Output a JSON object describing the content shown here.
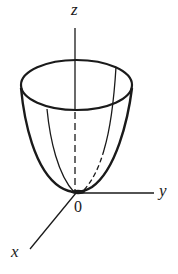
{
  "diagram": {
    "type": "paraboloid-3d-axes",
    "axes": {
      "z_label": "z",
      "y_label": "y",
      "x_label": "x",
      "origin_label": "0"
    },
    "colors": {
      "stroke": "#1a1a1a",
      "background": "#ffffff"
    }
  }
}
